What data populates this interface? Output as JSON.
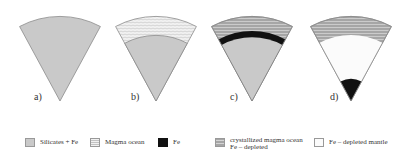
{
  "figure": {
    "panels": [
      {
        "id": "a",
        "label": "a)",
        "description": "Silicates + Fe uniform wedge"
      },
      {
        "id": "b",
        "label": "b)",
        "description": "Magma ocean over silicates + Fe"
      },
      {
        "id": "c",
        "label": "c)",
        "description": "Crystallized magma ocean, Fe layer, silicates + Fe"
      },
      {
        "id": "d",
        "label": "d)",
        "description": "Crystallized magma ocean, Fe-depleted mantle, Fe core"
      }
    ],
    "colors": {
      "silicates_fe": "#c9c9c9",
      "magma_ocean": "#efefef",
      "fe": "#111111",
      "crystallized": "#a9a9a9",
      "fe_depleted_mantle": "#fbfbfb",
      "outline": "#8a8a8a"
    }
  },
  "legend": {
    "items": [
      {
        "key": "silicates_fe",
        "label": "Silicates + Fe"
      },
      {
        "key": "magma_ocean",
        "label": "Magma ocean"
      },
      {
        "key": "fe",
        "label": "Fe"
      },
      {
        "key": "crystallized",
        "label": "crystallized magma ocean\nFe – depleted"
      },
      {
        "key": "fe_depleted_mantle",
        "label": "Fe – depleted mantle"
      }
    ]
  }
}
